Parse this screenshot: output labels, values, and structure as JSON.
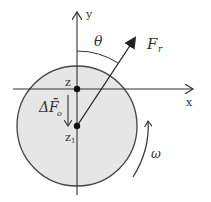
{
  "figure": {
    "width": 211,
    "height": 202,
    "colors": {
      "background": "#ffffff",
      "disk_fill": "#e6e6e6",
      "stroke": "#333333",
      "point": "#111111"
    },
    "disk": {
      "cx": 77,
      "cy": 126,
      "r": 60
    },
    "axes": {
      "x": {
        "label": "x",
        "y": 89,
        "x_start": 13,
        "x_end": 193
      },
      "y": {
        "label": "y",
        "x": 77,
        "y_start": 195,
        "y_end": 12
      }
    },
    "points": [
      {
        "id": "z",
        "label": "z",
        "x": 77,
        "y": 89
      },
      {
        "id": "z1",
        "label": "z",
        "subscript": "1",
        "x": 77,
        "y": 126
      }
    ],
    "vectors": {
      "force": {
        "label": "F",
        "subscript": "r",
        "from": [
          77,
          126
        ],
        "to": [
          135,
          38
        ]
      },
      "displacement": {
        "label": "ΔF̄",
        "subscript": "o",
        "from": [
          68,
          95
        ],
        "to": [
          68,
          126
        ]
      }
    },
    "angle": {
      "label": "θ"
    },
    "rotation": {
      "label": "ω"
    }
  }
}
